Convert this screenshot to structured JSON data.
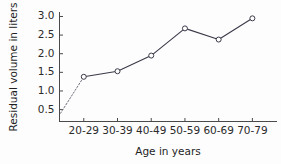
{
  "chart_data": {
    "type": "line",
    "title": "",
    "subtitle": "",
    "xlabel": "Age in years",
    "ylabel": "Residual volume in liters",
    "categories": [
      "20-29",
      "30-39",
      "40-49",
      "50-59",
      "60-69",
      "70-79"
    ],
    "values": [
      1.38,
      1.53,
      1.95,
      2.68,
      2.38,
      2.95
    ],
    "series": [
      {
        "name": "Residual volume",
        "values": [
          1.38,
          1.53,
          1.95,
          2.68,
          2.38,
          2.95
        ]
      }
    ],
    "leader_segment": {
      "style": "dotted",
      "from_y": 0.4,
      "to_category": "20-29",
      "to_y": 1.38
    },
    "ylim": [
      0.18,
      3.12
    ],
    "yticks": [
      0.5,
      1.0,
      1.5,
      2.0,
      2.5,
      3.0
    ],
    "ytick_labels": [
      "0.5",
      "1.0",
      "1.5",
      "2.0",
      "2.5",
      "3.0"
    ],
    "xtick_labels": [
      "20-29",
      "30-39",
      "40-49",
      "50-59",
      "60-69",
      "70-79"
    ],
    "grid": false,
    "legend": null,
    "legend_position": "none",
    "marker": "open-circle",
    "line_color": "#3a3a4a",
    "marker_edge_color": "#3a3a4a",
    "marker_face_color": "#ffffff",
    "axis_color": "#4a4a4a",
    "background_color": "#fdfdfd",
    "annotations": []
  },
  "axes": {
    "y_axis_label": "Residual volume in liters",
    "x_axis_label": "Age in years"
  }
}
